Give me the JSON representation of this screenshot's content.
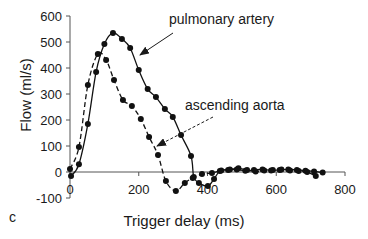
{
  "panel_label": "c",
  "chart_data": {
    "type": "line",
    "title": "",
    "xlabel": "Trigger delay (ms)",
    "ylabel": "Flow (ml/s)",
    "xlim": [
      0,
      800
    ],
    "ylim": [
      -100,
      600
    ],
    "xticks": [
      0,
      200,
      400,
      600,
      800
    ],
    "yticks": [
      -100,
      0,
      100,
      200,
      300,
      400,
      500,
      600
    ],
    "grid": false,
    "legend": "none (inline annotations with arrows)",
    "series": [
      {
        "name": "pulmonary artery",
        "line_style": "solid",
        "marker": "circle",
        "x": [
          3,
          26,
          52,
          76,
          100,
          125,
          151,
          175,
          200,
          226,
          250,
          276,
          299,
          323,
          352,
          360,
          375,
          401,
          419,
          436,
          460,
          485,
          510,
          535,
          560,
          585,
          610,
          635,
          660,
          685,
          710,
          735
        ],
        "y": [
          -15,
          30,
          185,
          385,
          492,
          535,
          512,
          477,
          392,
          319,
          288,
          242,
          212,
          142,
          62,
          -19,
          -42,
          -54,
          -27,
          4,
          8,
          10,
          5,
          8,
          10,
          6,
          8,
          10,
          8,
          5,
          2,
          -2
        ]
      },
      {
        "name": "ascending aorta",
        "line_style": "dashed",
        "marker": "circle",
        "x": [
          0,
          26,
          52,
          81,
          105,
          128,
          154,
          180,
          206,
          230,
          256,
          279,
          308,
          334,
          357,
          384,
          413,
          440,
          465,
          490,
          515,
          540,
          565,
          590,
          615,
          640,
          665,
          690,
          715
        ],
        "y": [
          12,
          96,
          335,
          454,
          431,
          354,
          277,
          254,
          204,
          135,
          65,
          -35,
          -73,
          -42,
          -23,
          -8,
          -4,
          6,
          10,
          14,
          8,
          2,
          6,
          8,
          10,
          6,
          4,
          0,
          -15
        ]
      }
    ],
    "annotations": [
      {
        "text": "pulmonary artery",
        "x": 169,
        "y": 24,
        "arrow_from": [
          173,
          33
        ],
        "arrow_to": [
          140,
          55
        ],
        "arrow_style": "solid"
      },
      {
        "text": "ascending aorta",
        "x": 185,
        "y": 110,
        "arrow_from": [
          213,
          117
        ],
        "arrow_to": [
          157,
          146
        ],
        "arrow_style": "dashed"
      }
    ]
  }
}
